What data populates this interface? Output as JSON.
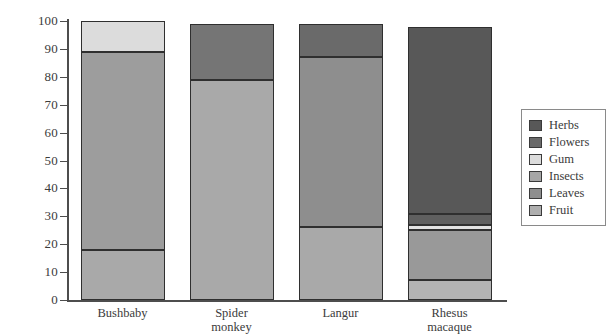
{
  "chart_data": {
    "type": "bar",
    "subtype": "stacked-bar-100",
    "title": "",
    "xlabel": "",
    "ylabel": "",
    "ylim": [
      0,
      100
    ],
    "yticks": [
      0,
      10,
      20,
      30,
      40,
      50,
      60,
      70,
      80,
      90,
      100
    ],
    "ytick_labels": [
      "0",
      "10",
      "20",
      "30",
      "40",
      "50",
      "60",
      "70",
      "80",
      "90",
      "100"
    ],
    "grid": false,
    "legend_position": "right",
    "categories": [
      "Bushbaby",
      "Spider monkey",
      "Langur",
      "Rhesus macaque"
    ],
    "category_labels": [
      [
        "Bushbaby"
      ],
      [
        "Spider",
        "monkey"
      ],
      [
        "Langur"
      ],
      [
        "Rhesus",
        "macaque"
      ]
    ],
    "series": [
      {
        "name": "Fruit",
        "color": "#a9a9a9",
        "values": [
          18,
          79,
          26,
          7
        ]
      },
      {
        "name": "Leaves",
        "color": "#8e8e8e",
        "values": [
          0,
          20,
          61,
          18
        ]
      },
      {
        "name": "Insects",
        "color": "#9d9d9d",
        "values": [
          71,
          0,
          0,
          0
        ]
      },
      {
        "name": "Gum",
        "color": "#dcdcdc",
        "values": [
          11,
          0,
          0,
          2
        ]
      },
      {
        "name": "Flowers",
        "color": "#6e6e6e",
        "values": [
          0,
          0,
          12,
          4
        ]
      },
      {
        "name": "Herbs",
        "color": "#5a5a5a",
        "values": [
          0,
          0,
          0,
          67
        ]
      }
    ],
    "bars": [
      {
        "category": "Bushbaby",
        "segments": [
          {
            "name": "Fruit",
            "value": 18,
            "start": 0,
            "end": 18,
            "color": "#a9a9a9"
          },
          {
            "name": "Insects",
            "value": 71,
            "start": 18,
            "end": 89,
            "color": "#9d9d9d"
          },
          {
            "name": "Gum",
            "value": 11,
            "start": 89,
            "end": 100,
            "color": "#dcdcdc"
          }
        ]
      },
      {
        "category": "Spider monkey",
        "segments": [
          {
            "name": "Fruit",
            "value": 79,
            "start": 0,
            "end": 79,
            "color": "#a9a9a9"
          },
          {
            "name": "Leaves",
            "value": 20,
            "start": 79,
            "end": 99,
            "color": "#757575"
          }
        ]
      },
      {
        "category": "Langur",
        "segments": [
          {
            "name": "Fruit",
            "value": 26,
            "start": 0,
            "end": 26,
            "color": "#a9a9a9"
          },
          {
            "name": "Leaves",
            "value": 61,
            "start": 26,
            "end": 87,
            "color": "#8e8e8e"
          },
          {
            "name": "Flowers",
            "value": 12,
            "start": 87,
            "end": 99,
            "color": "#6a6a6a"
          }
        ]
      },
      {
        "category": "Rhesus macaque",
        "segments": [
          {
            "name": "Fruit",
            "value": 7,
            "start": 0,
            "end": 7,
            "color": "#b4b4b4"
          },
          {
            "name": "Leaves",
            "value": 18,
            "start": 7,
            "end": 25,
            "color": "#999999"
          },
          {
            "name": "Gum",
            "value": 2,
            "start": 25,
            "end": 27,
            "color": "#e2e2e2"
          },
          {
            "name": "Flowers",
            "value": 4,
            "start": 27,
            "end": 31,
            "color": "#5f5f5f"
          },
          {
            "name": "Herbs",
            "value": 67,
            "start": 31,
            "end": 98,
            "color": "#585858"
          }
        ]
      }
    ]
  },
  "legend": {
    "items": [
      {
        "label": "Herbs",
        "color": "#585858"
      },
      {
        "label": "Flowers",
        "color": "#6a6a6a"
      },
      {
        "label": "Gum",
        "color": "#dcdcdc"
      },
      {
        "label": "Insects",
        "color": "#a6a6a6"
      },
      {
        "label": "Leaves",
        "color": "#8e8e8e"
      },
      {
        "label": "Fruit",
        "color": "#aeaeae"
      }
    ]
  }
}
